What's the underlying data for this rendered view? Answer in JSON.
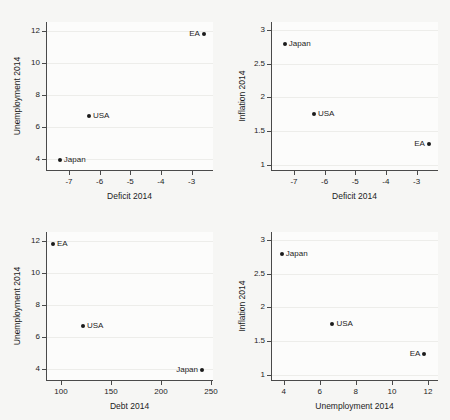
{
  "figure": {
    "background_color": "#f6f6f4",
    "plot_background_color": "#fcfcfb",
    "axis_color": "#4a4a4a",
    "grid_color": "#ededea",
    "marker_color": "#1b1b1b"
  },
  "chart_data": [
    {
      "id": "panel-top-left",
      "type": "scatter",
      "title": "",
      "xlabel": "Deficit 2014",
      "ylabel": "Unemployment 2014",
      "xlim": [
        -7.75,
        -2.3
      ],
      "ylim": [
        3.3,
        12.55
      ],
      "xticks": [
        -7,
        -6,
        -5,
        -4,
        -3
      ],
      "xticklabels": [
        "-7",
        "-6",
        "-5",
        "-4",
        "-3"
      ],
      "yticks": [
        4,
        6,
        8,
        10,
        12
      ],
      "yticklabels": [
        "4",
        "6",
        "8",
        "10",
        "12"
      ],
      "grid": true,
      "legend": "none",
      "points": [
        {
          "label": "Japan",
          "x": -7.3,
          "y": 3.9,
          "label_side": "right"
        },
        {
          "label": "USA",
          "x": -6.35,
          "y": 6.7,
          "label_side": "right"
        },
        {
          "label": "EA",
          "x": -2.6,
          "y": 11.8,
          "label_side": "left"
        }
      ]
    },
    {
      "id": "panel-top-right",
      "type": "scatter",
      "title": "",
      "xlabel": "Deficit 2014",
      "ylabel": "Inflation 2014",
      "xlim": [
        -7.75,
        -2.3
      ],
      "ylim": [
        0.92,
        3.12
      ],
      "xticks": [
        -7,
        -6,
        -5,
        -4,
        -3
      ],
      "xticklabels": [
        "-7",
        "-6",
        "-5",
        "-4",
        "-3"
      ],
      "yticks": [
        1,
        1.5,
        2,
        2.5,
        3
      ],
      "yticklabels": [
        "1",
        "1.5",
        "2",
        "2.5",
        "3"
      ],
      "grid": true,
      "legend": "none",
      "points": [
        {
          "label": "Japan",
          "x": -7.3,
          "y": 2.8,
          "label_side": "right"
        },
        {
          "label": "USA",
          "x": -6.35,
          "y": 1.75,
          "label_side": "right"
        },
        {
          "label": "EA",
          "x": -2.6,
          "y": 1.3,
          "label_side": "left"
        }
      ]
    },
    {
      "id": "panel-bottom-left",
      "type": "scatter",
      "title": "",
      "xlabel": "Debt 2014",
      "ylabel": "Unemployment 2014",
      "xlim": [
        85,
        252
      ],
      "ylim": [
        3.3,
        12.55
      ],
      "xticks": [
        100,
        150,
        200,
        250
      ],
      "xticklabels": [
        "100",
        "150",
        "200",
        "250"
      ],
      "yticks": [
        4,
        6,
        8,
        10,
        12
      ],
      "yticklabels": [
        "4",
        "6",
        "8",
        "10",
        "12"
      ],
      "grid": true,
      "legend": "none",
      "points": [
        {
          "label": "EA",
          "x": 92,
          "y": 11.8,
          "label_side": "right"
        },
        {
          "label": "USA",
          "x": 122,
          "y": 6.7,
          "label_side": "right"
        },
        {
          "label": "Japan",
          "x": 241,
          "y": 3.9,
          "label_side": "left"
        }
      ]
    },
    {
      "id": "panel-bottom-right",
      "type": "scatter",
      "title": "",
      "xlabel": "Unemployment 2014",
      "ylabel": "Inflation 2014",
      "xlim": [
        3.3,
        12.55
      ],
      "ylim": [
        0.92,
        3.12
      ],
      "xticks": [
        4,
        6,
        8,
        10,
        12
      ],
      "xticklabels": [
        "4",
        "6",
        "8",
        "10",
        "12"
      ],
      "yticks": [
        1,
        1.5,
        2,
        2.5,
        3
      ],
      "yticklabels": [
        "1",
        "1.5",
        "2",
        "2.5",
        "3"
      ],
      "grid": true,
      "legend": "none",
      "points": [
        {
          "label": "Japan",
          "x": 3.9,
          "y": 2.8,
          "label_side": "right"
        },
        {
          "label": "USA",
          "x": 6.7,
          "y": 1.75,
          "label_side": "right"
        },
        {
          "label": "EA",
          "x": 11.8,
          "y": 1.3,
          "label_side": "left"
        }
      ]
    }
  ]
}
